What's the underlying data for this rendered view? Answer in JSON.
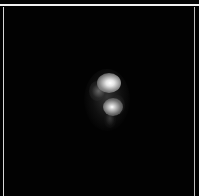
{
  "image": {
    "description": "Grayscale dark-field frame with a bright bilobed spot near the center",
    "background_color": "#000000",
    "frame_border_color": "#d8d8d8",
    "top_rule_color": "#f2f2f2",
    "features": [
      {
        "name": "primary-bright-spot",
        "center": [
          106,
          84
        ],
        "intensity": "high"
      },
      {
        "name": "secondary-bright-spot",
        "center": [
          110,
          107
        ],
        "intensity": "high"
      },
      {
        "name": "diffuse-halo",
        "bounds": [
          88,
          74,
          122,
          125
        ],
        "intensity": "low"
      }
    ]
  }
}
